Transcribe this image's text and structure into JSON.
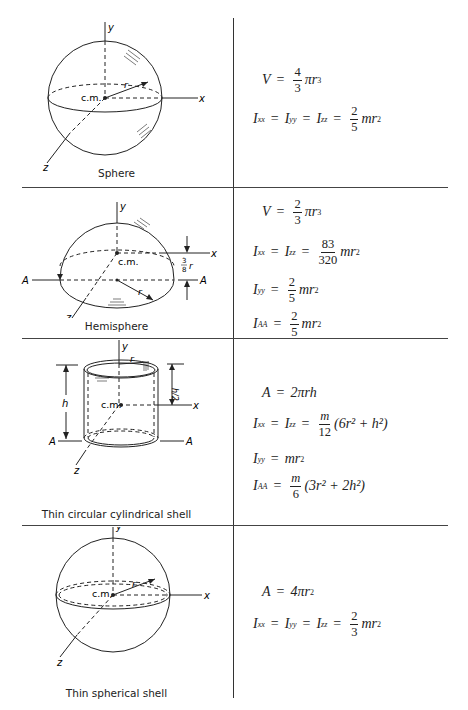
{
  "table": {
    "rows": [
      {
        "shape": "Sphere",
        "figure_labels": {
          "y": "y",
          "x": "x",
          "z": "z",
          "cm": "c.m.",
          "r": "r"
        },
        "formulas": [
          {
            "lhs": "V",
            "eq": "=",
            "num": "4",
            "den": "3",
            "rest": "πr",
            "pow": "3"
          },
          {
            "lhs1": "I",
            "sub1": "xx",
            "lhs2": "I",
            "sub2": "yy",
            "lhs3": "I",
            "sub3": "zz",
            "num": "2",
            "den": "5",
            "rest": "mr",
            "pow": "2"
          }
        ]
      },
      {
        "shape": "Hemisphere",
        "figure_labels": {
          "y": "y",
          "x": "x",
          "z": "z",
          "cm": "c.m.",
          "r": "r",
          "A_left": "A",
          "A_right": "A",
          "offset_num": "3",
          "offset_den": "8",
          "offset_var": "r"
        },
        "formulas": [
          {
            "lhs": "V",
            "num": "2",
            "den": "3",
            "rest": "πr",
            "pow": "3"
          },
          {
            "lhs1": "I",
            "sub1": "xx",
            "lhs2": "I",
            "sub2": "zz",
            "num": "83",
            "den": "320",
            "rest": "mr",
            "pow": "2"
          },
          {
            "lhs": "I",
            "sub": "yy",
            "num": "2",
            "den": "5",
            "rest": "mr",
            "pow": "2"
          },
          {
            "lhs": "I",
            "sub": "AA",
            "num": "2",
            "den": "5",
            "rest": "mr",
            "pow": "2"
          }
        ]
      },
      {
        "shape": "Thin circular cylindrical shell",
        "figure_labels": {
          "y": "y",
          "x": "x",
          "z": "z",
          "cm": "c.m.",
          "r": "r",
          "h": "h",
          "half_h": "h/2",
          "A_left": "A",
          "A_right": "A"
        },
        "formulas": [
          {
            "lhs": "A",
            "rhs": "2πrh"
          },
          {
            "lhs1": "I",
            "sub1": "xx",
            "lhs2": "I",
            "sub2": "zz",
            "num": "m",
            "den": "12",
            "rest": "(6r² + h²)"
          },
          {
            "lhs": "I",
            "sub": "yy",
            "rhs": "mr",
            "pow": "2"
          },
          {
            "lhs": "I",
            "sub": "AA",
            "num": "m",
            "den": "6",
            "rest": "(3r² + 2h²)"
          }
        ]
      },
      {
        "shape": "Thin spherical shell",
        "figure_labels": {
          "y": "y",
          "x": "x",
          "z": "z",
          "cm": "c.m.",
          "r": "r"
        },
        "formulas": [
          {
            "lhs": "A",
            "rhs": "4πr",
            "pow": "2"
          },
          {
            "lhs1": "I",
            "sub1": "xx",
            "lhs2": "I",
            "sub2": "yy",
            "lhs3": "I",
            "sub3": "zz",
            "num": "2",
            "den": "3",
            "rest": "mr",
            "pow": "2"
          }
        ]
      }
    ]
  },
  "symbols": {
    "equals": "="
  }
}
